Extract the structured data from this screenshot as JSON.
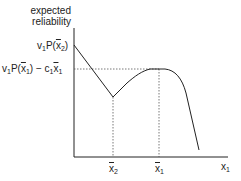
{
  "diagram": {
    "y_axis_label_line1": "expected",
    "y_axis_label_line2": "reliability",
    "x_axis_label": "x",
    "x_axis_label_sub": "1",
    "y_tick_top": {
      "v": "v",
      "v_sub": "1",
      "P": "P(",
      "x": "x",
      "x_sub": "2",
      "close": ")"
    },
    "y_tick_mid": {
      "v": "v",
      "v_sub": "1",
      "P": "P(",
      "x": "x",
      "x_sub": "1",
      "close": ") − c",
      "c_sub": "1",
      "x2": "x",
      "x2_sub": "1"
    },
    "x_tick_left": {
      "x": "x",
      "sub": "2"
    },
    "x_tick_right": {
      "x": "x",
      "sub": "1"
    },
    "colors": {
      "line": "#222222",
      "dotted": "#555555"
    }
  }
}
